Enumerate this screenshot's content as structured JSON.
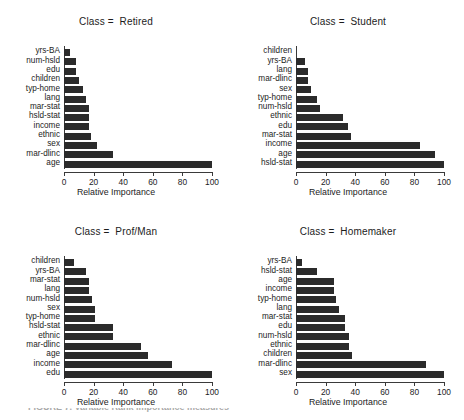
{
  "figure": {
    "background": "#ffffff",
    "bar_color": "#2b2b2b",
    "axis_color": "#3a3a3a",
    "caption_fragment": "FIGURE 7.  Variable  Rank  importance  measures",
    "axis_title": "Relative Importance",
    "tick_labels": [
      "0",
      "20",
      "40",
      "60",
      "80",
      "100"
    ]
  },
  "chart_data": {
    "type": "bar",
    "orientation": "horizontal",
    "title": "",
    "xlabel": "Relative Importance",
    "ylabel": "",
    "xlim": [
      0,
      100
    ],
    "xticks": [
      0,
      20,
      40,
      60,
      80,
      100
    ],
    "grid": false,
    "legend": "none",
    "panels": [
      {
        "title": "Class =  Retired",
        "categories": [
          "yrs-BA",
          "num-hsld",
          "edu",
          "children",
          "typ-home",
          "lang",
          "mar-stat",
          "hsld-stat",
          "income",
          "ethnic",
          "sex",
          "mar-dlinc",
          "age"
        ],
        "values": [
          4,
          8,
          8,
          10,
          13,
          15,
          17,
          17,
          17,
          18,
          22,
          33,
          100
        ]
      },
      {
        "title": "Class =  Student",
        "categories": [
          "children",
          "yrs-BA",
          "lang",
          "mar-dlinc",
          "sex",
          "typ-home",
          "num-hsld",
          "ethnic",
          "edu",
          "mar-stat",
          "income",
          "age",
          "hsld-stat"
        ],
        "values": [
          0,
          6,
          8,
          8,
          10,
          14,
          16,
          32,
          35,
          37,
          84,
          94,
          100
        ]
      },
      {
        "title": "Class =  Prof/Man",
        "categories": [
          "children",
          "yrs-BA",
          "mar-stat",
          "lang",
          "num-hsld",
          "sex",
          "typ-home",
          "hsld-stat",
          "ethnic",
          "mar-dlinc",
          "age",
          "income",
          "edu"
        ],
        "values": [
          7,
          15,
          17,
          17,
          19,
          21,
          21,
          33,
          33,
          52,
          57,
          73,
          100
        ]
      },
      {
        "title": "Class =  Homemaker",
        "categories": [
          "yrs-BA",
          "hsld-stat",
          "age",
          "income",
          "typ-home",
          "lang",
          "mar-stat",
          "edu",
          "num-hsld",
          "ethnic",
          "children",
          "mar-dlinc",
          "sex"
        ],
        "values": [
          4,
          14,
          26,
          26,
          27,
          29,
          33,
          33,
          36,
          36,
          38,
          88,
          100
        ]
      }
    ]
  }
}
